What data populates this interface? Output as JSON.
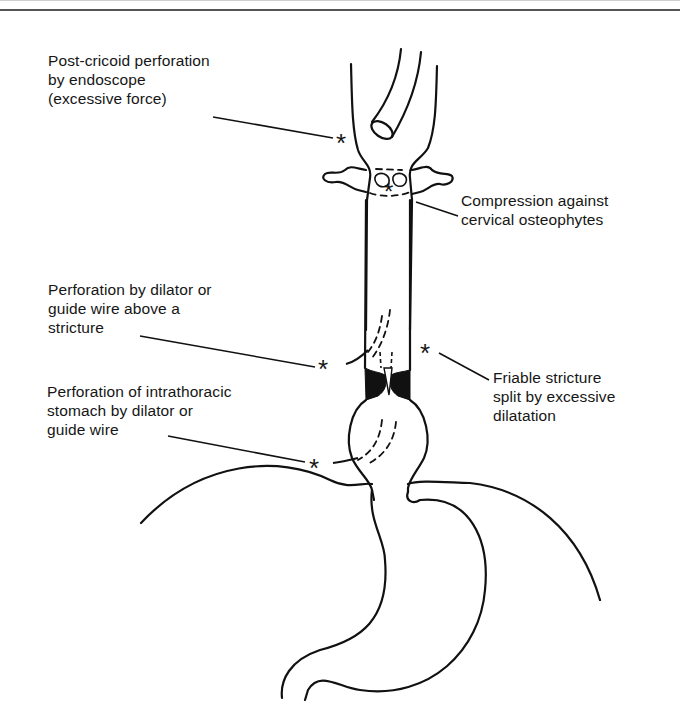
{
  "figure": {
    "type": "anatomical-line-diagram",
    "marker_symbol": "*",
    "line_color": "#111111",
    "background_color": "#ffffff"
  },
  "labels": [
    {
      "id": "post-cricoid",
      "lines": [
        "Post-cricoid perforation",
        "by endoscope",
        "(excessive force)"
      ],
      "text": "Post-cricoid perforation\nby endoscope\n(excessive force)"
    },
    {
      "id": "cervical-osteophytes",
      "lines": [
        "Compression against",
        "cervical osteophytes"
      ],
      "text": "Compression against\ncervical osteophytes"
    },
    {
      "id": "above-stricture",
      "lines": [
        "Perforation by dilator or",
        "guide wire above a",
        "stricture"
      ],
      "text": "Perforation by dilator or\nguide wire above a\nstricture"
    },
    {
      "id": "friable-stricture",
      "lines": [
        "Friable stricture",
        "split by excessive",
        "dilatation"
      ],
      "text": "Friable stricture\nsplit by excessive\ndilatation"
    },
    {
      "id": "intrathoracic-stomach",
      "lines": [
        "Perforation of intrathoracic",
        "stomach by dilator or",
        "guide wire"
      ],
      "text": "Perforation of intrathoracic\nstomach by dilator or\nguide wire"
    }
  ],
  "markers": {
    "post_cricoid": "*",
    "cervical": "*",
    "above_stricture": "*",
    "friable_stricture": "*",
    "intrathoracic": "*"
  }
}
